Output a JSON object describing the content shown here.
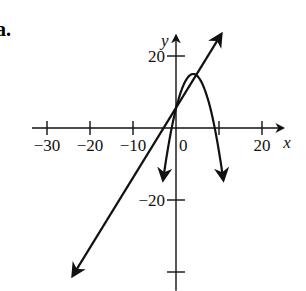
{
  "part_label": "a.",
  "chart_data": {
    "type": "line",
    "title": "",
    "xlabel": "x",
    "ylabel": "y",
    "xlim": [
      -31,
      24
    ],
    "ylim": [
      -43,
      24
    ],
    "grid": false,
    "x_ticks": [
      -30,
      -20,
      -10,
      0,
      10,
      20
    ],
    "x_tick_labels": [
      "−30",
      "−20",
      "−10",
      "0",
      "",
      "20"
    ],
    "y_ticks": [
      20,
      -20,
      -40
    ],
    "y_tick_labels": [
      "20",
      "−20",
      ""
    ],
    "series": [
      {
        "name": "line",
        "kind": "line",
        "x": [
          -24,
          10.5
        ],
        "y": [
          -41,
          26
        ],
        "arrows": "both"
      },
      {
        "name": "parabola",
        "kind": "parabola",
        "vertex": [
          4,
          15
        ],
        "x_intercepts": [
          -1,
          9
        ],
        "x": [
          -3,
          -1,
          0,
          2,
          4,
          6,
          8,
          9,
          11
        ],
        "y": [
          -43,
          0,
          5.5,
          13.5,
          15,
          13.5,
          5.5,
          0,
          -43
        ],
        "arrows": "both-ends-down"
      }
    ],
    "intersections": [
      [
        -0.5,
        1
      ],
      [
        5.5,
        14
      ]
    ]
  }
}
